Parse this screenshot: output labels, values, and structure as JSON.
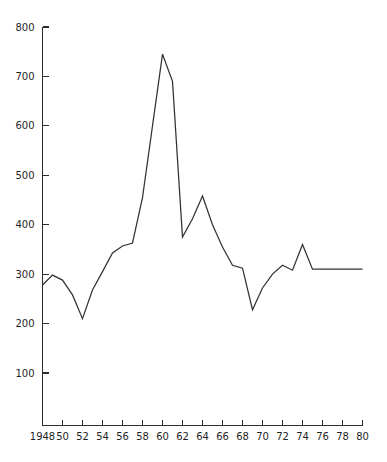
{
  "chart_data": {
    "type": "line",
    "title": "",
    "subtitle": "",
    "xlabel": "",
    "ylabel": "",
    "xlim": [
      1948,
      1980
    ],
    "ylim": [
      0,
      800
    ],
    "grid": false,
    "legend": false,
    "legend_position": "none",
    "y_ticks": [
      100,
      200,
      300,
      400,
      500,
      600,
      700,
      800
    ],
    "y_tick_labels": [
      "100",
      "200",
      "300",
      "400",
      "500",
      "600",
      "700",
      "800"
    ],
    "x_ticks": [
      1948,
      1950,
      1952,
      1954,
      1956,
      1958,
      1960,
      1962,
      1964,
      1966,
      1968,
      1970,
      1972,
      1974,
      1976,
      1978,
      1980
    ],
    "x_tick_labels": [
      "1948",
      "50",
      "52",
      "54",
      "56",
      "58",
      "60",
      "62",
      "64",
      "66",
      "68",
      "70",
      "72",
      "74",
      "76",
      "78",
      "80"
    ],
    "series": [
      {
        "name": "series-1",
        "color": "#333333",
        "x": [
          1948,
          1949,
          1950,
          1951,
          1952,
          1953,
          1954,
          1955,
          1956,
          1957,
          1958,
          1959,
          1960,
          1961,
          1962,
          1963,
          1964,
          1965,
          1966,
          1967,
          1968,
          1969,
          1970,
          1971,
          1972,
          1973,
          1974,
          1975,
          1976,
          1977,
          1978,
          1979,
          1980
        ],
        "values": [
          278,
          298,
          288,
          258,
          210,
          268,
          305,
          343,
          357,
          363,
          455,
          600,
          745,
          690,
          375,
          412,
          458,
          400,
          355,
          318,
          312,
          228,
          272,
          300,
          318,
          308,
          360,
          310,
          310,
          310,
          310,
          310,
          310
        ]
      }
    ],
    "annotations": []
  },
  "axes": {
    "y_axis_name": "y-axis",
    "x_axis_name": "x-axis"
  }
}
